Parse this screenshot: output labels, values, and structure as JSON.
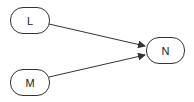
{
  "diagram": {
    "nodes": [
      {
        "id": "L",
        "label": "L"
      },
      {
        "id": "M",
        "label": "M"
      },
      {
        "id": "N",
        "label": "N"
      }
    ],
    "edges": [
      {
        "from": "L",
        "to": "N"
      },
      {
        "from": "M",
        "to": "N"
      }
    ],
    "colors": {
      "stroke": "#333333",
      "fill": "#ffffff"
    }
  }
}
